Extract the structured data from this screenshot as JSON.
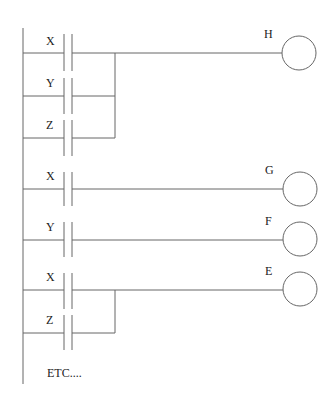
{
  "diagram": {
    "type": "ladder-logic",
    "rungs": [
      {
        "output": "H",
        "logic": "OR",
        "contacts": [
          "X",
          "Y",
          "Z"
        ]
      },
      {
        "output": "G",
        "logic": "NO",
        "contacts": [
          "X"
        ]
      },
      {
        "output": "F",
        "logic": "NO",
        "contacts": [
          "Y"
        ]
      },
      {
        "output": "E",
        "logic": "OR",
        "contacts": [
          "X",
          "Z"
        ]
      }
    ],
    "labels": {
      "r1_c1": "X",
      "r1_c2": "Y",
      "r1_c3": "Z",
      "r1_out": "H",
      "r2_c1": "X",
      "r2_out": "G",
      "r3_c1": "Y",
      "r3_out": "F",
      "r4_c1": "X",
      "r4_c2": "Z",
      "r4_out": "E",
      "footer": "ETC...."
    }
  }
}
